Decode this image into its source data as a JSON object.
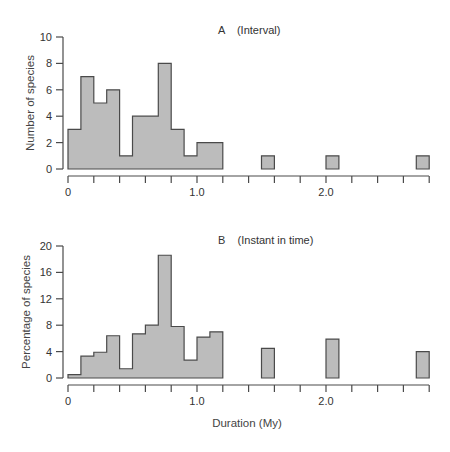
{
  "chart_data": [
    {
      "type": "bar",
      "title": "A    (Interval)",
      "panel": "A",
      "xlabel": "",
      "ylabel": "Number of species",
      "ylim": [
        0,
        10
      ],
      "yticks": [
        0,
        2,
        4,
        6,
        8,
        10
      ],
      "xlim": [
        0,
        2.8
      ],
      "xtick_labels": [
        "0",
        "1.0",
        "2.0"
      ],
      "xtick_step": 0.2,
      "bin_width": 0.1,
      "grid": false,
      "bins": [
        {
          "start": 0.0,
          "value": 3
        },
        {
          "start": 0.1,
          "value": 7
        },
        {
          "start": 0.2,
          "value": 5
        },
        {
          "start": 0.3,
          "value": 6
        },
        {
          "start": 0.4,
          "value": 1
        },
        {
          "start": 0.5,
          "value": 4
        },
        {
          "start": 0.6,
          "value": 4
        },
        {
          "start": 0.7,
          "value": 8
        },
        {
          "start": 0.8,
          "value": 3
        },
        {
          "start": 0.9,
          "value": 1
        },
        {
          "start": 1.0,
          "value": 2
        },
        {
          "start": 1.1,
          "value": 2
        },
        {
          "start": 1.5,
          "value": 1
        },
        {
          "start": 2.0,
          "value": 1
        },
        {
          "start": 2.7,
          "value": 1
        }
      ]
    },
    {
      "type": "bar",
      "title": "B    (Instant in time)",
      "panel": "B",
      "xlabel": "Duration (My)",
      "ylabel": "Percentage of species",
      "ylim": [
        0,
        20
      ],
      "yticks": [
        0,
        4,
        8,
        12,
        16,
        20
      ],
      "xlim": [
        0,
        2.8
      ],
      "xtick_labels": [
        "0",
        "1.0",
        "2.0"
      ],
      "xtick_step": 0.2,
      "bin_width": 0.1,
      "grid": false,
      "bins": [
        {
          "start": 0.0,
          "value": 0.5
        },
        {
          "start": 0.1,
          "value": 3.3
        },
        {
          "start": 0.2,
          "value": 3.9
        },
        {
          "start": 0.3,
          "value": 6.4
        },
        {
          "start": 0.4,
          "value": 1.4
        },
        {
          "start": 0.5,
          "value": 6.7
        },
        {
          "start": 0.6,
          "value": 8.0
        },
        {
          "start": 0.7,
          "value": 18.6
        },
        {
          "start": 0.8,
          "value": 7.8
        },
        {
          "start": 0.9,
          "value": 2.7
        },
        {
          "start": 1.0,
          "value": 6.2
        },
        {
          "start": 1.1,
          "value": 7.0
        },
        {
          "start": 1.5,
          "value": 4.5
        },
        {
          "start": 2.0,
          "value": 5.9
        },
        {
          "start": 2.7,
          "value": 4.0
        }
      ]
    }
  ],
  "panels": {
    "a": {
      "title": "A    (Interval)",
      "ylabel": "Number of species",
      "yticks": [
        "0",
        "2",
        "4",
        "6",
        "8",
        "10"
      ],
      "xticks": [
        "0",
        "1.0",
        "2.0"
      ]
    },
    "b": {
      "title": "B    (Instant in time)",
      "ylabel": "Percentage of species",
      "yticks": [
        "0",
        "4",
        "8",
        "12",
        "16",
        "20"
      ],
      "xticks": [
        "0",
        "1.0",
        "2.0"
      ],
      "xlabel": "Duration (My)"
    }
  },
  "colors": {
    "bar_fill": "#bcbcbc",
    "bar_stroke": "#4a4a4a",
    "axis": "#4a4a4a",
    "text": "#333333"
  }
}
